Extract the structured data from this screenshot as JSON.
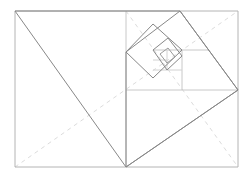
{
  "figure": {
    "title": "Nested rotated squares in a dynamic rectangle",
    "canvas": {
      "width": 247,
      "height": 178
    },
    "colors": {
      "background": "#ffffff",
      "frame": "#b4b4b4",
      "subdivision": "#c8c8c8",
      "subdivision_fine": "#d2d2d2",
      "spiral": "#888888",
      "spiral_fine": "#9a9a9a",
      "dashed_diagonal": "#dcdcdc"
    },
    "outer_rectangle": {
      "name": "outer-rectangle",
      "x": 15,
      "y": 11,
      "width": 223,
      "height": 156,
      "points": "15,11 238,11 238,167 15,167"
    },
    "subdivision_lines": [
      {
        "name": "vertical-divider",
        "x1": 126,
        "y1": 11,
        "x2": 126,
        "y2": 167
      },
      {
        "name": "horizontal-divider",
        "x1": 126,
        "y1": 90,
        "x2": 238,
        "y2": 90
      },
      {
        "name": "inner-horizontal-divider",
        "x1": 153,
        "y1": 50,
        "x2": 209,
        "y2": 50
      },
      {
        "name": "inner-vertical-divider",
        "x1": 182,
        "y1": 50,
        "x2": 182,
        "y2": 90
      },
      {
        "name": "micro-horizontal-divider",
        "x1": 153,
        "y1": 70,
        "x2": 182,
        "y2": 70
      },
      {
        "name": "micro-vertical-divider",
        "x1": 167,
        "y1": 50,
        "x2": 167,
        "y2": 70
      },
      {
        "name": "micro-horizontal-divider-2",
        "x1": 153,
        "y1": 60,
        "x2": 167,
        "y2": 60
      }
    ],
    "dashed_diagonals": [
      {
        "name": "dashed-diagonal-main",
        "x1": 15,
        "y1": 167,
        "x2": 238,
        "y2": 11
      },
      {
        "name": "dashed-diagonal-reciprocal",
        "x1": 126,
        "y1": 11,
        "x2": 238,
        "y2": 167
      }
    ],
    "spiral_squares": [
      {
        "name": "spiral-square-1",
        "points": "15,11 126,167 238,90 180,11",
        "order": 1
      },
      {
        "name": "spiral-square-2",
        "points": "126,52 180,11 238,90 126,167",
        "order": 2
      },
      {
        "name": "spiral-square-3",
        "points": "126,52 153,78 182,50 153,24",
        "order": 3
      },
      {
        "name": "spiral-square-4",
        "points": "153,50 167,70 182,56 168,38",
        "order": 4
      }
    ],
    "spiral_squares_fine": [
      {
        "name": "spiral-square-5",
        "points": "160,54 167,63 175,57 168,48",
        "order": 5
      }
    ]
  }
}
